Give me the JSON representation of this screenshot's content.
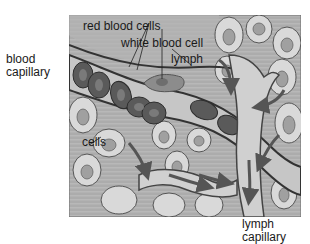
{
  "diagram": {
    "labels": {
      "blood_capillary_1": "blood",
      "blood_capillary_2": "capillary",
      "red_blood_cells": "red blood cells",
      "white_blood_cell": "white blood cell",
      "lymph": "lymph",
      "cells": "cells",
      "lymph_capillary_1": "lymph",
      "lymph_capillary_2": "capillary"
    },
    "colors": {
      "background": "#a8a8a8",
      "tissue_fluid": "#bdbdbd",
      "cell_fill": "#d9d9d9",
      "nucleus": "#a0a0a0",
      "vessel_wall": "#3a3a3a",
      "red_cell": "#5a5a5a",
      "red_cell_center": "#7a7a7a",
      "white_cell": "#8c8c8c",
      "lymph_vessel": "#cfcfcf",
      "arrow": "#555555"
    }
  }
}
